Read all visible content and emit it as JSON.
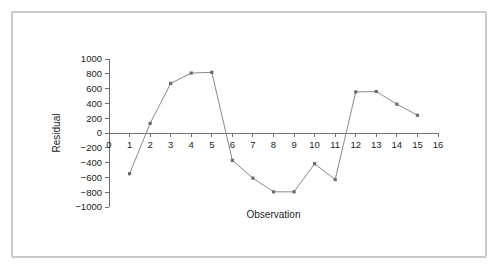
{
  "figure": {
    "artifact_text": "▪  ▪"
  },
  "chart_data": {
    "type": "line",
    "title": "",
    "xlabel": "Observation",
    "ylabel": "Residual",
    "x": [
      1,
      2,
      3,
      4,
      5,
      6,
      7,
      8,
      9,
      10,
      11,
      12,
      13,
      14,
      15
    ],
    "values": [
      -550,
      130,
      670,
      810,
      820,
      -370,
      -610,
      -795,
      -795,
      -415,
      -630,
      555,
      560,
      390,
      240
    ],
    "series": [
      {
        "name": "Residual",
        "values": [
          -550,
          130,
          670,
          810,
          820,
          -370,
          -610,
          -795,
          -795,
          -415,
          -630,
          555,
          560,
          390,
          240
        ]
      }
    ],
    "xlim": [
      0,
      16
    ],
    "ylim": [
      -1000,
      1000
    ],
    "xticks": [
      0,
      1,
      2,
      3,
      4,
      5,
      6,
      7,
      8,
      9,
      10,
      11,
      12,
      13,
      14,
      15,
      16
    ],
    "xtick_labels": [
      "0",
      "1",
      "2",
      "3",
      "4",
      "5",
      "6",
      "7",
      "8",
      "9",
      "10",
      "11",
      "12",
      "13",
      "14",
      "15",
      "16"
    ],
    "yticks": [
      -1000,
      -800,
      -600,
      -400,
      -200,
      0,
      200,
      400,
      600,
      800,
      1000
    ],
    "ytick_labels": [
      "−1000",
      "−800",
      "−600",
      "−400",
      "−200",
      "0",
      "200",
      "400",
      "600",
      "800",
      "1000"
    ],
    "grid": false,
    "legend": false,
    "marker": "square",
    "line_color": "#8a8a8a",
    "marker_color": "#6b6b6b",
    "axis_color": "#6f6f6f"
  }
}
